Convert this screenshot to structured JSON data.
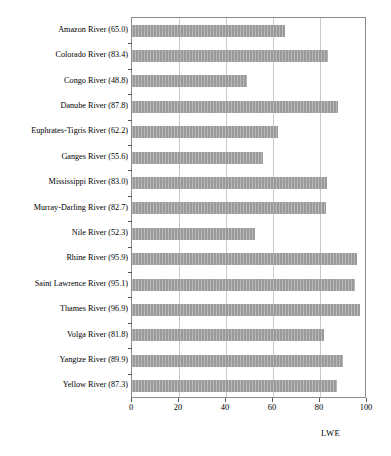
{
  "chart_data": {
    "type": "bar",
    "orientation": "horizontal",
    "title": "",
    "subtitle": "",
    "xlabel": "LWE",
    "ylabel": "",
    "xlim": [
      0,
      100
    ],
    "xticks": [
      0,
      20,
      40,
      60,
      80,
      100
    ],
    "xtick_labels": [
      "0",
      "20",
      "40",
      "60",
      "80",
      "100"
    ],
    "grid": "vertical",
    "legend": "none",
    "bar_color": "#9a9a9a",
    "bar_edge_color": "#9a9a9a",
    "background_color": "#ffffff",
    "frame_color": "#8c8c8c",
    "gridline_color": "#c9c9c9",
    "categories": [
      "Amazon River (65.0)",
      "Colorado River (83.4)",
      "Congo River (48.8)",
      "Danube River (87.8)",
      "Euphrates-Tigris River (62.2)",
      "Ganges River (55.6)",
      "Mississippi River (83.0)",
      "Murray-Darling River (82.7)",
      "Nile River (52.3)",
      "Rhine River (95.9)",
      "Saint Lawrence River (95.1)",
      "Thames River (96.9)",
      "Volga River (81.8)",
      "Yangtze River (89.9)",
      "Yellow River (87.3)"
    ],
    "category_names": [
      "Amazon River",
      "Colorado River",
      "Congo River",
      "Danube River",
      "Euphrates-Tigris River",
      "Ganges River",
      "Mississippi River",
      "Murray-Darling River",
      "Nile River",
      "Rhine River",
      "Saint Lawrence River",
      "Thames River",
      "Volga River",
      "Yangtze River",
      "Yellow River"
    ],
    "values": [
      65.0,
      83.4,
      48.8,
      87.8,
      62.2,
      55.6,
      83.0,
      82.7,
      52.3,
      95.9,
      95.1,
      96.9,
      81.8,
      89.9,
      87.3
    ]
  }
}
